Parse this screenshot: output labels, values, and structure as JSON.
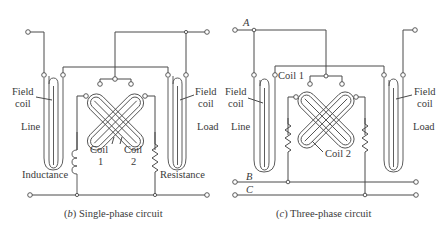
{
  "figure": {
    "panels": [
      {
        "id": "b",
        "caption_letter": "(b)",
        "caption_text": "Single-phase circuit",
        "labels": {
          "field_coil_left": [
            "Field",
            "coil"
          ],
          "field_coil_right": [
            "Field",
            "coil"
          ],
          "line": "Line",
          "load": "Load",
          "coil1": [
            "Coil",
            "1"
          ],
          "coil2": [
            "Coil",
            "2"
          ],
          "inductance": "Inductance",
          "resistance": "Resistance"
        }
      },
      {
        "id": "c",
        "caption_letter": "(c)",
        "caption_text": "Three-phase circuit",
        "labels": {
          "field_coil_left": [
            "Field",
            "coil"
          ],
          "field_coil_right": [
            "Field",
            "coil"
          ],
          "line": "Line",
          "load": "Load",
          "coil1": "Coil 1",
          "coil2": "Coil 2",
          "phase_a": "A",
          "phase_b": "B",
          "phase_c": "C"
        }
      }
    ]
  }
}
